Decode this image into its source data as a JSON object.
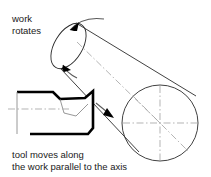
{
  "diagram": {
    "background_color": "#ffffff",
    "line_color": "#2b2b2b",
    "tool_color": "#000000",
    "centerline_color": "#a6a6a6",
    "arrow_color": "#000000",
    "labels": {
      "rotation_line1": "work",
      "rotation_line2": "rotates",
      "feed_line1": "tool moves along",
      "feed_line2": "the work parallel to the axis"
    },
    "parts": {
      "workpiece": "cylindrical-workpiece",
      "end_face": "circular-end-face",
      "tool": "cutting-tool",
      "axis": "axis-centerline",
      "rotation_arrow_top": "rotation-direction-arrow",
      "rotation_arrow_lower": "rotation-direction-arrow-secondary",
      "feed_arrow": "feed-direction-arrow"
    }
  }
}
